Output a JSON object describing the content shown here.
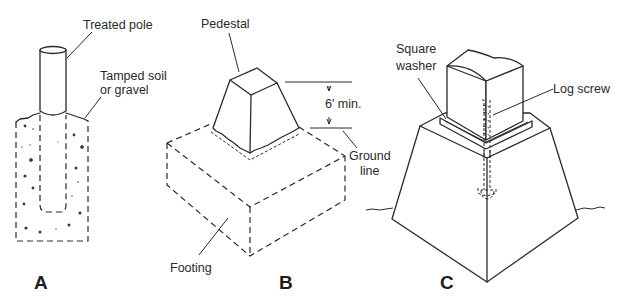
{
  "figure": {
    "panels": [
      {
        "id": "A",
        "letter": "A",
        "labels": {
          "pole": "Treated pole",
          "soil_line1": "Tamped soil",
          "soil_line2": "or gravel"
        }
      },
      {
        "id": "B",
        "letter": "B",
        "labels": {
          "pedestal": "Pedestal",
          "dimension": "6′ min.",
          "ground_line1": "Ground",
          "ground_line2": "line",
          "footing": "Footing"
        }
      },
      {
        "id": "C",
        "letter": "C",
        "labels": {
          "washer_line1": "Square",
          "washer_line2": "washer",
          "screw": "Log screw"
        }
      }
    ]
  }
}
